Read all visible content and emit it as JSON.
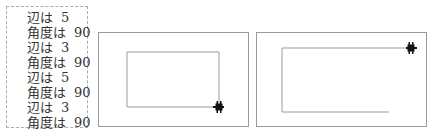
{
  "output": {
    "lines": [
      {
        "label": "辺は",
        "value": "5"
      },
      {
        "label": "角度は",
        "value": "90"
      },
      {
        "label": "辺は",
        "value": "3"
      },
      {
        "label": "角度は",
        "value": "90"
      },
      {
        "label": "辺は",
        "value": "5"
      },
      {
        "label": "角度は",
        "value": "90"
      },
      {
        "label": "辺は",
        "value": "3"
      },
      {
        "label": "角度は",
        "value": "90"
      }
    ]
  },
  "canvases": [
    {
      "name": "turtle-canvas-1",
      "path_color": "#999999",
      "turtle_color": "#111111"
    },
    {
      "name": "turtle-canvas-2",
      "path_color": "#999999",
      "turtle_color": "#111111"
    }
  ]
}
